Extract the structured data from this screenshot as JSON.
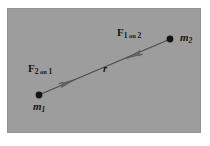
{
  "figure": {
    "background_color": "#9d9d9d",
    "page_color": "#ffffff",
    "ink_color": "#151515",
    "panel": {
      "x": 7,
      "y": 8,
      "width": 194,
      "height": 125
    }
  },
  "labels": {
    "force_on_2": {
      "symbol": "F",
      "subscript_pre": "1",
      "subscript_on": " on ",
      "subscript_post": "2",
      "text": "F1 on 2"
    },
    "force_on_1": {
      "symbol": "F",
      "subscript_pre": "2",
      "subscript_on": " on ",
      "subscript_post": "1",
      "text": "F2 on 1"
    },
    "mass_1": {
      "symbol": "m",
      "subscript": "1",
      "text": "m1"
    },
    "mass_2": {
      "symbol": "m",
      "subscript": "2",
      "text": "m2"
    },
    "separation": {
      "symbol": "r",
      "text": "r"
    }
  },
  "diagram_data": {
    "type": "vector-diagram",
    "bodies": [
      {
        "name": "mass-1",
        "label": "m1",
        "x": 39,
        "y": 95,
        "radius": 3.4,
        "color": "#151515"
      },
      {
        "name": "mass-2",
        "label": "m2",
        "x": 170,
        "y": 39,
        "radius": 3.4,
        "color": "#151515"
      }
    ],
    "connector": {
      "name": "separation-line",
      "from": [
        39,
        95
      ],
      "to": [
        170,
        39
      ],
      "stroke": "#4a4a4a",
      "stroke_width": 1.3,
      "label": "r"
    },
    "vectors": [
      {
        "name": "force-2-on-1",
        "label": "F2 on 1",
        "points_toward": "mass-2",
        "arrow_tip": [
          72,
          81
        ],
        "arrow_tail": [
          47,
          92
        ],
        "color": "#5a5a5a"
      },
      {
        "name": "force-1-on-2",
        "label": "F1 on 2",
        "points_toward": "mass-1",
        "arrow_tip": [
          129,
          57
        ],
        "arrow_tail": [
          156,
          45
        ],
        "color": "#5a5a5a"
      }
    ]
  }
}
